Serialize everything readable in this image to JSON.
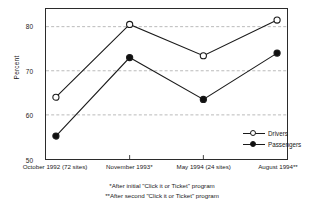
{
  "chart_data": {
    "type": "line",
    "title": "",
    "xlabel": "",
    "ylabel": "Percent",
    "ylim": [
      50,
      84
    ],
    "yticks": [
      50,
      60,
      70,
      80
    ],
    "ytick_labels": [
      "50",
      "60",
      "70",
      "80"
    ],
    "grid": "horizontal-dashed",
    "legend_position": "inside-lower-right",
    "categories": [
      "October 1992 (72 sites)",
      "November 1993*",
      "May 1994 (24 sites)",
      "August 1994**"
    ],
    "series": [
      {
        "name": "Drivers",
        "marker": "open-circle",
        "values": [
          64.0,
          80.5,
          73.4,
          81.5
        ]
      },
      {
        "name": "Passengers",
        "marker": "filled-circle",
        "values": [
          55.2,
          73.0,
          63.5,
          74.0
        ]
      }
    ],
    "annotations": [
      "*After initial \"Click it or Ticket\" program",
      "**After second \"Click it or Ticket\" program"
    ]
  },
  "colors": {
    "line": "#1a1a1a",
    "grid": "#a8a8a8",
    "axis": "#2b2b2b",
    "background": "#ffffff"
  },
  "footnotes": [
    "*After initial \"Click it or Ticket\" program",
    "**After second \"Click it or Ticket\" program"
  ]
}
